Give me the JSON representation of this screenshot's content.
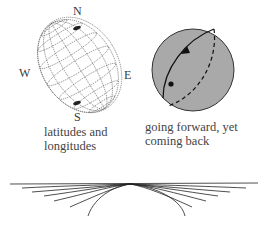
{
  "globe": {
    "compass": {
      "north": "N",
      "south": "S",
      "west": "W",
      "east": "E"
    },
    "caption_line1": "latitudes and",
    "caption_line2": "longitudes",
    "icon": "wireframe-globe-icon"
  },
  "sphere": {
    "caption_line1": "going forward, yet",
    "caption_line2": "coming back",
    "fill_color": "#a9a9a9",
    "icon": "great-circle-sphere-icon"
  },
  "fan": {
    "icon": "tangent-curves-fan-icon"
  }
}
